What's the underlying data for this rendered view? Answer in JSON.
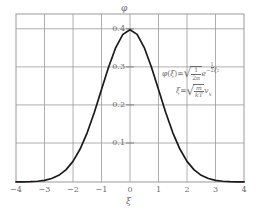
{
  "chart_data": {
    "type": "line",
    "title": "",
    "xlabel": "ξ",
    "ylabel": "φ",
    "xlim": [
      -4,
      4
    ],
    "ylim": [
      0,
      0.44
    ],
    "grid": true,
    "legend": "none",
    "x_ticks": [
      "−4",
      "−3",
      "−2",
      "−1",
      "0",
      "1",
      "2",
      "3",
      "4"
    ],
    "x_tick_values": [
      -4,
      -3,
      -2,
      -1,
      0,
      1,
      2,
      3,
      4
    ],
    "y_ticks": [
      "0.1",
      "0.2",
      "0.3",
      "0.4"
    ],
    "y_tick_values": [
      0.1,
      0.2,
      0.3,
      0.4
    ],
    "curve_color": "#1a1a1a",
    "grid_color": "#9a9a9a",
    "series": [
      {
        "name": "φ(ξ)",
        "x": [
          -4,
          -3.75,
          -3.5,
          -3.25,
          -3,
          -2.75,
          -2.5,
          -2.25,
          -2,
          -1.75,
          -1.5,
          -1.25,
          -1,
          -0.75,
          -0.5,
          -0.25,
          0,
          0.25,
          0.5,
          0.75,
          1,
          1.25,
          1.5,
          1.75,
          2,
          2.25,
          2.5,
          2.75,
          3,
          3.25,
          3.5,
          3.75,
          4
        ],
        "values": [
          0.0001,
          0.0004,
          0.0009,
          0.002,
          0.0044,
          0.0091,
          0.0175,
          0.0317,
          0.054,
          0.0863,
          0.1295,
          0.1826,
          0.242,
          0.3011,
          0.3521,
          0.3867,
          0.3989,
          0.3867,
          0.3521,
          0.3011,
          0.242,
          0.1826,
          0.1295,
          0.0863,
          0.054,
          0.0317,
          0.0175,
          0.0091,
          0.0044,
          0.002,
          0.0009,
          0.0004,
          0.0001
        ]
      }
    ],
    "annotations": [
      {
        "id": "phi-definition",
        "text": "φ(ξ) = √(1/2π) e^(−½ξ²)",
        "parts": {
          "lhs": "φ",
          "arg_open": "(",
          "arg": "ξ",
          "arg_close": ")",
          "equals": "=",
          "frac_num": "1",
          "frac_den": "2π",
          "exp_base": "e",
          "exp_minus": "−",
          "exp_frac_num": "1",
          "exp_frac_den": "2",
          "exp_var": "ξ",
          "exp_power": "2"
        }
      },
      {
        "id": "xi-definition",
        "text": "ξ = √(m/kT) v_x",
        "parts": {
          "lhs": "ξ",
          "equals": "=",
          "frac_num": "m",
          "frac_den": "kT",
          "tail_var": "v",
          "tail_sub": "x"
        }
      }
    ]
  },
  "axes": {
    "y_label": "φ",
    "x_label": "ξ"
  }
}
